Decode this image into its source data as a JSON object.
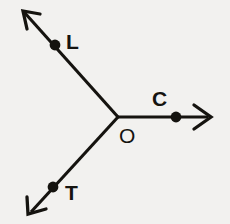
{
  "figure": {
    "kind": "geometry-rays-diagram",
    "background_color": "#f2f1ef",
    "ink_color": "#15130f",
    "width": 230,
    "height": 224,
    "vertex": {
      "name": "O",
      "label": "O",
      "label_x": 130,
      "label_y": 142,
      "x": 118,
      "y": 117
    },
    "rays": [
      {
        "name": "ray-OL",
        "point_label": "L",
        "dot": {
          "x": 55,
          "y": 45,
          "r": 5.4
        },
        "label_x": 69,
        "label_y": 48,
        "start": {
          "x": 118,
          "y": 117
        },
        "end": {
          "x": 24,
          "y": 12
        },
        "arrow_tip": {
          "x": 22,
          "y": 10
        },
        "stroke_width": 3.1
      },
      {
        "name": "ray-OC",
        "point_label": "C",
        "dot": {
          "x": 176,
          "y": 117,
          "r": 5.4
        },
        "label_x": 153,
        "label_y": 105,
        "start": {
          "x": 118,
          "y": 117
        },
        "end": {
          "x": 208,
          "y": 117
        },
        "arrow_tip": {
          "x": 212,
          "y": 117
        },
        "stroke_width": 3.1
      },
      {
        "name": "ray-OT",
        "point_label": "T",
        "dot": {
          "x": 53,
          "y": 187,
          "r": 5.4
        },
        "label_x": 65,
        "label_y": 200,
        "start": {
          "x": 118,
          "y": 117
        },
        "end": {
          "x": 31,
          "y": 212
        },
        "arrow_tip": {
          "x": 28,
          "y": 215
        },
        "stroke_width": 3.1
      }
    ],
    "arrowheads": [
      {
        "name": "arrowhead-upper-left",
        "path": "M 40 13 L 23 11 L 27 29"
      },
      {
        "name": "arrowhead-right",
        "path": "M 194 105 L 211 117 L 194 129"
      },
      {
        "name": "arrowhead-lower-left",
        "path": "M 27 198 L 28 214 L 46 210"
      }
    ]
  }
}
